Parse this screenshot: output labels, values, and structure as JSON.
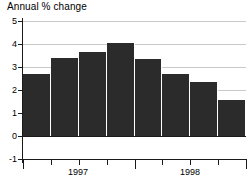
{
  "chart_data": {
    "type": "bar",
    "title": "Annual % change",
    "xlabel": "",
    "ylabel": "",
    "ylim": [
      -1,
      5
    ],
    "yticks": [
      5,
      4,
      3,
      2,
      1,
      0,
      -1
    ],
    "ytick_labels": [
      "5",
      "4",
      "3",
      "2",
      "1",
      "0",
      "-1"
    ],
    "gridlines": [
      5,
      4,
      3,
      2,
      1
    ],
    "grid": true,
    "legend": "none",
    "categories": [
      "1997 Q1",
      "1997 Q2",
      "1997 Q3",
      "1997 Q4",
      "1998 Q1",
      "1998 Q2",
      "1998 Q3",
      "1998 Q4"
    ],
    "values": [
      2.7,
      3.4,
      3.65,
      4.05,
      3.35,
      2.7,
      2.35,
      1.55
    ],
    "xtick_labels": [
      "1997",
      "1998"
    ],
    "bar_color": "#2b2b2b",
    "grid_color": "#c9c9c9",
    "axis_color": "#1a1a1a"
  },
  "axis": {
    "y_labels": [
      {
        "text": "5",
        "value": 5
      },
      {
        "text": "4",
        "value": 4
      },
      {
        "text": "3",
        "value": 3
      },
      {
        "text": "2",
        "value": 2
      },
      {
        "text": "1",
        "value": 1
      },
      {
        "text": "0",
        "value": 0
      },
      {
        "text": "-1",
        "value": -1
      }
    ],
    "x_labels": [
      {
        "text": "1997",
        "center": 78
      },
      {
        "text": "1998",
        "center": 190
      }
    ]
  }
}
